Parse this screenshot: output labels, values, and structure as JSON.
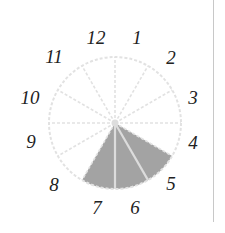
{
  "diagram": {
    "type": "sector-clock",
    "center": [
      115,
      123
    ],
    "radius": 66,
    "sector_count": 12,
    "labels": [
      "1",
      "2",
      "3",
      "4",
      "5",
      "6",
      "7",
      "8",
      "9",
      "10",
      "11",
      "12"
    ],
    "label_positions": {
      "1": [
        137,
        44
      ],
      "2": [
        171,
        64
      ],
      "3": [
        193,
        104
      ],
      "4": [
        193,
        149
      ],
      "5": [
        171,
        190
      ],
      "6": [
        135,
        214
      ],
      "7": [
        97,
        214
      ],
      "8": [
        54,
        191
      ],
      "9": [
        31,
        148
      ],
      "10": [
        30,
        104
      ],
      "11": [
        54,
        63
      ],
      "12": [
        96,
        44
      ]
    },
    "filled_sectors": [
      "5",
      "6",
      "7"
    ],
    "colors": {
      "fill": "#a3a3a3",
      "fill_separator": "#dcdcdc",
      "grid": "#e2e2e2",
      "label": "#222222",
      "divider": "#c8c8c8"
    }
  },
  "chart_data": {
    "type": "pie",
    "categories": [
      "1",
      "2",
      "3",
      "4",
      "5",
      "6",
      "7",
      "8",
      "9",
      "10",
      "11",
      "12"
    ],
    "values": [
      0,
      0,
      0,
      0,
      1,
      1,
      1,
      0,
      0,
      0,
      0,
      0
    ],
    "title": "",
    "note": "12 equal sectors arranged like a clock face; sectors 5, 6 and 7 are shaded gray"
  }
}
